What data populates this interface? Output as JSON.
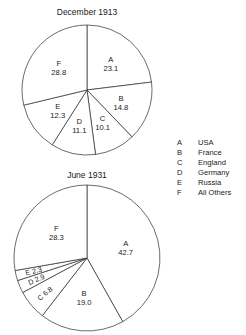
{
  "chart_data": [
    {
      "type": "pie",
      "title": "December 1913",
      "categories": [
        "A",
        "B",
        "C",
        "D",
        "E",
        "F"
      ],
      "values": [
        23.1,
        14.8,
        10.1,
        11.1,
        12.3,
        28.8
      ],
      "value_labels": [
        "23.1",
        "14.8",
        "10.1",
        "11.1",
        "12.3",
        "28.8"
      ],
      "start_angle_deg": 0,
      "direction": "clockwise",
      "center": [
        87,
        90
      ],
      "radius": 65,
      "legend_position": "right",
      "grid": false,
      "xlabel": "",
      "ylabel": ""
    },
    {
      "type": "pie",
      "title": "June 1931",
      "categories": [
        "A",
        "B",
        "C",
        "D",
        "E",
        "F"
      ],
      "values": [
        42.7,
        19.0,
        6.8,
        2.9,
        2.3,
        28.3
      ],
      "value_labels": [
        "42.7",
        "19.0",
        "6.8",
        "2.9",
        "2.3",
        "28.3"
      ],
      "start_angle_deg": 0,
      "direction": "clockwise",
      "center": [
        87,
        258
      ],
      "radius": 73,
      "legend_position": "right",
      "grid": false,
      "xlabel": "",
      "ylabel": ""
    }
  ],
  "legend": {
    "entries": [
      {
        "key": "A",
        "name": "USA"
      },
      {
        "key": "B",
        "name": "France"
      },
      {
        "key": "C",
        "name": "England"
      },
      {
        "key": "D",
        "name": "Germany"
      },
      {
        "key": "E",
        "name": "Russia"
      },
      {
        "key": "F",
        "name": "All Others"
      }
    ]
  },
  "style": {
    "stroke_color": "#2b2b2b",
    "slice_fill": "#ffffff",
    "text_color": "#1a1a1a",
    "background": "#ffffff"
  }
}
